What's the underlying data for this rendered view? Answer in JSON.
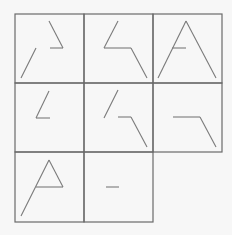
{
  "colors": {
    "background": "#f7f7f7",
    "grid": "#6a6a6a",
    "stroke": "#7a7a7a"
  },
  "grid": {
    "cells": [
      {
        "row": 0,
        "col": 0,
        "x": 15,
        "y": 14,
        "w": 69,
        "h": 69
      },
      {
        "row": 0,
        "col": 1,
        "x": 84,
        "y": 14,
        "w": 69,
        "h": 69
      },
      {
        "row": 0,
        "col": 2,
        "x": 153,
        "y": 14,
        "w": 69,
        "h": 69
      },
      {
        "row": 1,
        "col": 0,
        "x": 15,
        "y": 83,
        "w": 69,
        "h": 69
      },
      {
        "row": 1,
        "col": 1,
        "x": 84,
        "y": 83,
        "w": 69,
        "h": 69
      },
      {
        "row": 1,
        "col": 2,
        "x": 153,
        "y": 83,
        "w": 69,
        "h": 69
      },
      {
        "row": 2,
        "col": 0,
        "x": 15,
        "y": 152,
        "w": 69,
        "h": 70
      },
      {
        "row": 2,
        "col": 1,
        "x": 84,
        "y": 152,
        "w": 69,
        "h": 70
      }
    ]
  },
  "figures": [
    {
      "name": "figure-1",
      "segments": [
        [
          49,
          21,
          63,
          48
        ],
        [
          50,
          48,
          63,
          48
        ],
        [
          36,
          48,
          21,
          78
        ]
      ]
    },
    {
      "name": "figure-2",
      "segments": [
        [
          118,
          21,
          104,
          48
        ],
        [
          104,
          48,
          131,
          48
        ],
        [
          131,
          48,
          147,
          78
        ]
      ]
    },
    {
      "name": "figure-3",
      "segments": [
        [
          186,
          21,
          158,
          78
        ],
        [
          186,
          21,
          216,
          78
        ],
        [
          172,
          48,
          186,
          48
        ]
      ]
    },
    {
      "name": "figure-4",
      "segments": [
        [
          49,
          91,
          36,
          118
        ],
        [
          36,
          118,
          50,
          118
        ]
      ]
    },
    {
      "name": "figure-5",
      "segments": [
        [
          118,
          90,
          104,
          118
        ],
        [
          118,
          117,
          131,
          117
        ],
        [
          131,
          117,
          147,
          147
        ]
      ]
    },
    {
      "name": "figure-6",
      "segments": [
        [
          173,
          117,
          200,
          117
        ],
        [
          200,
          117,
          216,
          147
        ]
      ]
    },
    {
      "name": "figure-7",
      "segments": [
        [
          49,
          160,
          63,
          187
        ],
        [
          36,
          187,
          63,
          187
        ],
        [
          49,
          160,
          21,
          216
        ]
      ]
    },
    {
      "name": "figure-8",
      "segments": [
        [
          106,
          187,
          119,
          187
        ]
      ]
    }
  ]
}
